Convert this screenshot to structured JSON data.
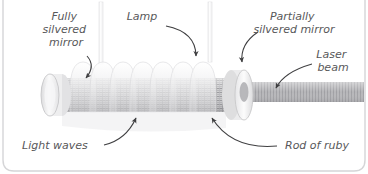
{
  "figure": {
    "background_color": "#ffffff",
    "frame_color": "#d5d5d7",
    "label_color": "#58585a",
    "leader_color": "#4a4a4c"
  },
  "labels": [
    {
      "name": "fully-silvered-mirror",
      "lines": [
        "Fully",
        "silvered",
        "mirror"
      ],
      "anchor": "middle",
      "x": 66,
      "y": 20,
      "line_height": 13,
      "font_size": 11
    },
    {
      "name": "lamp",
      "lines": [
        "Lamp"
      ],
      "anchor": "middle",
      "x": 142,
      "y": 20,
      "line_height": 13,
      "font_size": 11
    },
    {
      "name": "partially-silvered-mirror",
      "lines": [
        "Partially",
        "silvered mirror"
      ],
      "anchor": "middle",
      "x": 294,
      "y": 20,
      "line_height": 13,
      "font_size": 11
    },
    {
      "name": "laser-beam",
      "lines": [
        "Laser",
        "beam"
      ],
      "anchor": "middle",
      "x": 333,
      "y": 58,
      "line_height": 13,
      "font_size": 11
    },
    {
      "name": "light-waves",
      "lines": [
        "Light waves"
      ],
      "anchor": "start",
      "x": 22,
      "y": 149,
      "line_height": 13,
      "font_size": 11
    },
    {
      "name": "rod-of-ruby",
      "lines": [
        "Rod of ruby"
      ],
      "anchor": "start",
      "x": 285,
      "y": 149,
      "line_height": 13,
      "font_size": 11
    }
  ],
  "components": {
    "ruby_rod": {
      "name": "Rod of ruby",
      "fill": "#c9c9cb",
      "hatch": "#8e8e92"
    },
    "fully_silvered_mirror": {
      "name": "Fully silvered mirror",
      "fill": "#eeeeef",
      "edge": "#bcbcbe"
    },
    "partially_silvered_mirror": {
      "name": "Partially silvered mirror",
      "fill": "#f2f2f3",
      "edge": "#c2c2c4"
    },
    "lamp": {
      "name": "Helical flash lamp",
      "fill": "#f3f3f4",
      "edge": "#dcdcde",
      "coil_count": 8
    },
    "laser_beam": {
      "name": "Laser beam",
      "fill": "#b2b2b5",
      "stripe": "#9a9a9e"
    }
  }
}
